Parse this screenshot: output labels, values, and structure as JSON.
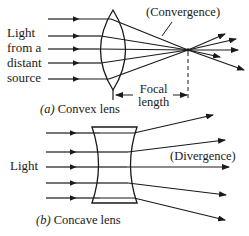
{
  "panel_a": {
    "source_label": [
      "Light",
      "from a",
      "distant",
      "source"
    ],
    "annotation": "(Convergence)",
    "focal_label": [
      "Focal",
      "length"
    ],
    "caption_letter": "(a)",
    "caption_text": "Convex lens"
  },
  "panel_b": {
    "source_label": "Light",
    "annotation": "(Divergence)",
    "caption_letter": "(b)",
    "caption_text": "Concave lens"
  },
  "colors": {
    "ink": "#1a1a1a",
    "background": "#ffffff"
  }
}
